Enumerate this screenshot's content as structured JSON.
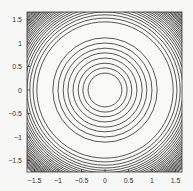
{
  "chart_data": {
    "type": "contour",
    "title": "",
    "xlabel": "",
    "ylabel": "",
    "xlim": [
      -1.65,
      1.65
    ],
    "ylim": [
      -1.65,
      1.65
    ],
    "grid": false,
    "legend": null,
    "x_ticks": [
      -1.5,
      -1,
      -0.5,
      0,
      0.5,
      1,
      1.5
    ],
    "x_tick_labels": [
      "−1.5",
      "−1",
      "−0.5",
      "0",
      "0.5",
      "1",
      "1.5"
    ],
    "y_ticks": [
      1.5,
      1,
      0.5,
      0,
      -0.5,
      -1,
      -1.5
    ],
    "y_tick_labels": [
      "1.5",
      "1",
      "0.5",
      "0",
      "−0.5",
      "−1",
      "−1.5"
    ],
    "center": [
      0,
      0
    ],
    "contour_shape": "concentric circles",
    "inner_contour_radii": [
      0.36,
      0.47,
      0.57,
      0.68,
      0.79,
      0.89,
      1.0,
      1.11
    ],
    "outer_contour_radii": [
      1.45,
      1.53,
      1.6,
      1.66,
      1.71,
      1.76,
      1.8,
      1.84,
      1.88,
      1.915,
      1.95,
      1.98,
      2.01,
      2.04,
      2.065,
      2.09,
      2.115,
      2.14,
      2.16,
      2.18,
      2.2,
      2.22,
      2.24,
      2.26,
      2.28,
      2.3,
      2.32,
      2.34
    ],
    "line_color": "#444444",
    "background": "#f7f7f5"
  }
}
